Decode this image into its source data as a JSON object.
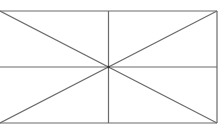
{
  "diagram": {
    "stroke_color": "#6b6b6b",
    "stroke_width": 1.2,
    "rect": {
      "x": 0,
      "y": 11,
      "width": 217,
      "height": 112
    },
    "center": {
      "x": 108.5,
      "y": 67
    }
  }
}
